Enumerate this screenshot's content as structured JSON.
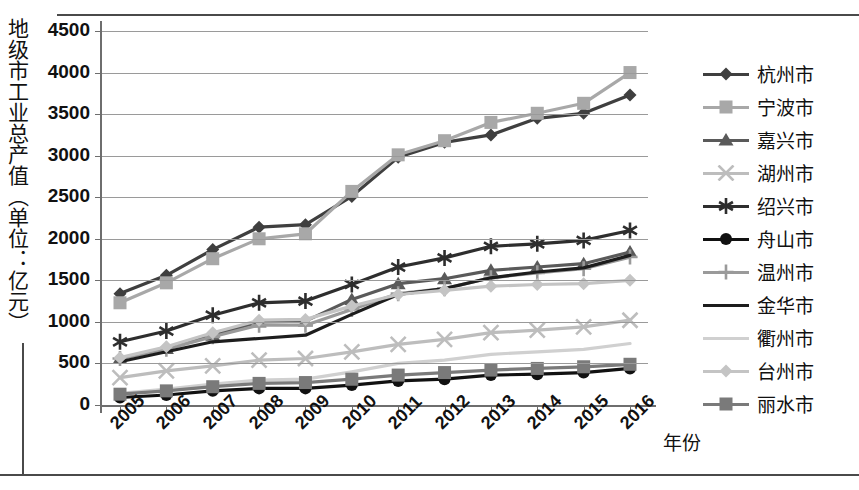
{
  "axis": {
    "y_title": "地级市工业总产值（单位：亿元）",
    "x_title": "年份",
    "y_ticks": [
      "4500",
      "4000",
      "3500",
      "3000",
      "2500",
      "2000",
      "1500",
      "1000",
      "500",
      "0"
    ],
    "x_ticks": [
      "2005",
      "2006",
      "2007",
      "2008",
      "2009",
      "2010",
      "2011",
      "2012",
      "2013",
      "2014",
      "2015",
      "2016"
    ]
  },
  "legend": {
    "items": [
      {
        "label": "杭州市",
        "marker": "diamond",
        "color": "#3f3f3f"
      },
      {
        "label": "宁波市",
        "marker": "square",
        "color": "#a8a8a8"
      },
      {
        "label": "嘉兴市",
        "marker": "triangle",
        "color": "#5a5a5a"
      },
      {
        "label": "湖州市",
        "marker": "x",
        "color": "#bdbdbd"
      },
      {
        "label": "绍兴市",
        "marker": "asterisk",
        "color": "#2e2e2e"
      },
      {
        "label": "舟山市",
        "marker": "circle",
        "color": "#111111"
      },
      {
        "label": "温州市",
        "marker": "plus",
        "color": "#9a9a9a"
      },
      {
        "label": "金华市",
        "marker": "none",
        "color": "#1d1d1d"
      },
      {
        "label": "衢州市",
        "marker": "none",
        "color": "#d0d0d0"
      },
      {
        "label": "台州市",
        "marker": "diamond",
        "color": "#c4c4c4"
      },
      {
        "label": "丽水市",
        "marker": "square",
        "color": "#7a7a7a"
      }
    ]
  },
  "chart_data": {
    "type": "line",
    "title": "",
    "xlabel": "年份",
    "ylabel": "地级市工业总产值（单位：亿元）",
    "x": [
      "2005",
      "2006",
      "2007",
      "2008",
      "2009",
      "2010",
      "2011",
      "2012",
      "2013",
      "2014",
      "2015",
      "2016"
    ],
    "ylim": [
      0,
      4500
    ],
    "ytick_step": 500,
    "grid": true,
    "legend_position": "right",
    "series": [
      {
        "name": "杭州市",
        "marker": "diamond",
        "color": "#3f3f3f",
        "values": [
          1340,
          1560,
          1870,
          2140,
          2170,
          2510,
          2980,
          3160,
          3250,
          3450,
          3510,
          3730
        ]
      },
      {
        "name": "宁波市",
        "marker": "square",
        "color": "#a8a8a8",
        "values": [
          1230,
          1470,
          1760,
          2000,
          2060,
          2570,
          3010,
          3180,
          3400,
          3510,
          3630,
          4000
        ]
      },
      {
        "name": "嘉兴市",
        "marker": "triangle",
        "color": "#5a5a5a",
        "values": [
          560,
          680,
          840,
          1000,
          1010,
          1270,
          1460,
          1520,
          1620,
          1660,
          1700,
          1840
        ]
      },
      {
        "name": "湖州市",
        "marker": "x",
        "color": "#bdbdbd",
        "values": [
          330,
          410,
          470,
          540,
          560,
          640,
          730,
          790,
          870,
          900,
          940,
          1020
        ]
      },
      {
        "name": "绍兴市",
        "marker": "asterisk",
        "color": "#2e2e2e",
        "values": [
          760,
          890,
          1080,
          1230,
          1250,
          1450,
          1660,
          1770,
          1910,
          1940,
          1980,
          2100
        ]
      },
      {
        "name": "舟山市",
        "marker": "circle",
        "color": "#111111",
        "values": [
          90,
          120,
          170,
          200,
          200,
          240,
          290,
          310,
          360,
          370,
          390,
          440
        ]
      },
      {
        "name": "温州市",
        "marker": "plus",
        "color": "#9a9a9a",
        "values": [
          560,
          670,
          820,
          960,
          960,
          1150,
          1340,
          1400,
          1530,
          1590,
          1640,
          1780
        ]
      },
      {
        "name": "金华市",
        "marker": "none",
        "color": "#1d1d1d",
        "values": [
          520,
          640,
          760,
          800,
          840,
          1090,
          1330,
          1400,
          1530,
          1600,
          1650,
          1800
        ]
      },
      {
        "name": "衢州市",
        "marker": "none",
        "color": "#d0d0d0",
        "values": [
          140,
          190,
          250,
          300,
          310,
          400,
          500,
          540,
          610,
          640,
          670,
          740
        ]
      },
      {
        "name": "台州市",
        "marker": "diamond",
        "color": "#c4c4c4",
        "values": [
          570,
          700,
          870,
          1020,
          1030,
          1190,
          1330,
          1380,
          1430,
          1450,
          1460,
          1500
        ]
      },
      {
        "name": "丽水市",
        "marker": "square",
        "color": "#7a7a7a",
        "values": [
          130,
          170,
          220,
          260,
          270,
          310,
          360,
          390,
          420,
          440,
          460,
          490
        ]
      }
    ]
  }
}
